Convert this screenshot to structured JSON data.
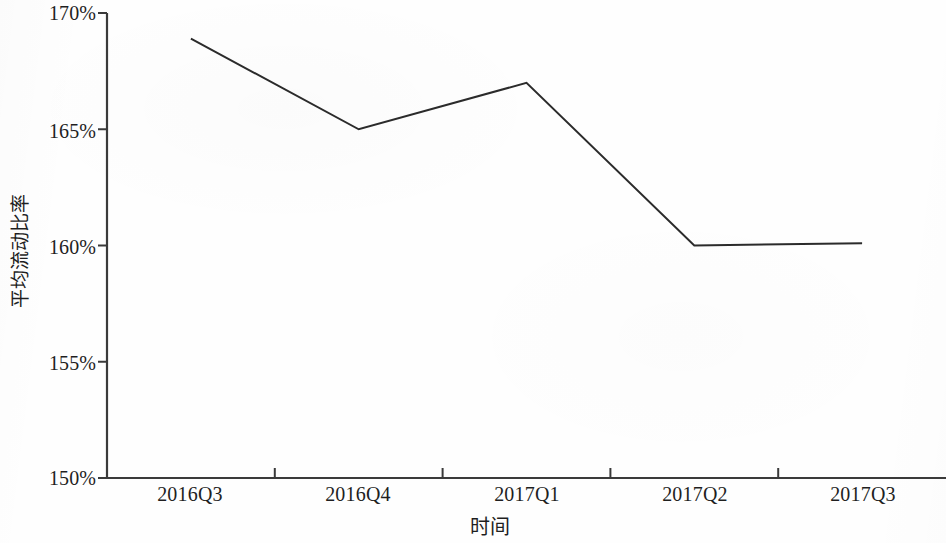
{
  "chart_data": {
    "type": "line",
    "title": "",
    "xlabel": "时间",
    "ylabel": "平均流动比率",
    "categories": [
      "2016Q3",
      "2016Q4",
      "2017Q1",
      "2017Q2",
      "2017Q3"
    ],
    "values": [
      168.9,
      165.0,
      167.0,
      160.0,
      160.1
    ],
    "value_labels": [
      "168.9%",
      "165.0%",
      "167.0%",
      "160.0%",
      "160.1%"
    ],
    "ylim": [
      150,
      170
    ],
    "y_ticks": [
      150,
      155,
      160,
      165,
      170
    ],
    "y_tick_labels": [
      "150%",
      "155%",
      "160%",
      "165%",
      "170%"
    ],
    "x_tick_labels": [
      "2016Q3",
      "2016Q4",
      "2017Q1",
      "2017Q2",
      "2017Q3"
    ],
    "grid": false,
    "legend": false,
    "legend_position": "none",
    "series": [
      {
        "name": "平均流动比率",
        "values": [
          168.9,
          165.0,
          167.0,
          160.0,
          160.1
        ],
        "color": "#2b2b2b",
        "line_width": 2
      }
    ],
    "axis_color": "#3a3a3a",
    "background_color": "#ffffff"
  },
  "axes": {
    "y_title": "平均流动比率",
    "x_title": "时间"
  }
}
